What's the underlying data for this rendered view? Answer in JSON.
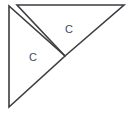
{
  "figure": {
    "background_color": "#ffffff",
    "stroke_color": "#3d3d42",
    "label_color": "#4a4a4f",
    "canvas": {
      "width": 131,
      "height": 115
    },
    "shapes": [
      {
        "name": "lower-left-triangle",
        "type": "triangle",
        "points": "9,6 9,107 65,56",
        "label": "C"
      },
      {
        "name": "upper-right-triangle",
        "type": "triangle",
        "points": "17,5 124,5 65,56",
        "label": "C"
      }
    ],
    "labels": [
      {
        "name": "c-upper",
        "text": "C",
        "x": 65,
        "y": 24
      },
      {
        "name": "c-lower",
        "text": "C",
        "x": 29,
        "y": 52
      }
    ]
  }
}
